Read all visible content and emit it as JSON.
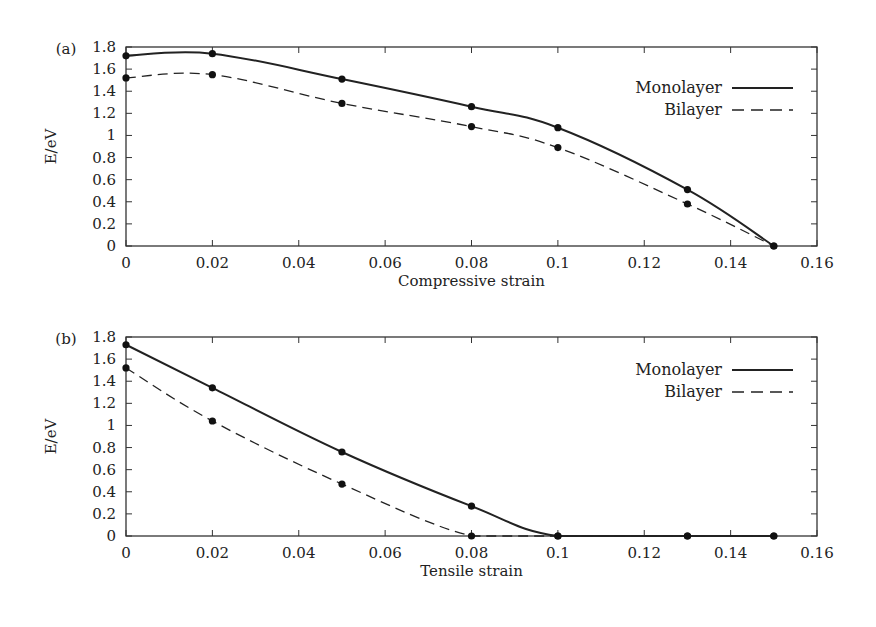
{
  "chart_data": [
    {
      "type": "line",
      "panel_label": "(a)",
      "xlabel": "Compressive strain",
      "ylabel": "E/eV",
      "xlim": [
        0,
        0.16
      ],
      "ylim": [
        0,
        1.8
      ],
      "xticks": [
        "0",
        "0.02",
        "0.04",
        "0.06",
        "0.08",
        "0.1",
        "0.12",
        "0.14",
        "0.16"
      ],
      "yticks": [
        "0",
        "0.2",
        "0.4",
        "0.6",
        "0.8",
        "1",
        "1.2",
        "1.4",
        "1.6",
        "1.8"
      ],
      "legend_position": "top-right",
      "x": [
        0,
        0.02,
        0.05,
        0.08,
        0.1,
        0.13,
        0.15
      ],
      "series": [
        {
          "name": "Monolayer",
          "style": "solid",
          "values": [
            1.72,
            1.74,
            1.51,
            1.26,
            1.07,
            0.51,
            0.0
          ]
        },
        {
          "name": "Bilayer",
          "style": "dashed",
          "values": [
            1.52,
            1.55,
            1.29,
            1.08,
            0.89,
            0.38,
            0.0
          ]
        }
      ]
    },
    {
      "type": "line",
      "panel_label": "(b)",
      "xlabel": "Tensile strain",
      "ylabel": "E/eV",
      "xlim": [
        0,
        0.16
      ],
      "ylim": [
        0,
        1.8
      ],
      "xticks": [
        "0",
        "0.02",
        "0.04",
        "0.06",
        "0.08",
        "0.1",
        "0.12",
        "0.14",
        "0.16"
      ],
      "yticks": [
        "0",
        "0.2",
        "0.4",
        "0.6",
        "0.8",
        "1",
        "1.2",
        "1.4",
        "1.6",
        "1.8"
      ],
      "legend_position": "top-right",
      "x": [
        0,
        0.02,
        0.05,
        0.08,
        0.1,
        0.13,
        0.15
      ],
      "series": [
        {
          "name": "Monolayer",
          "style": "solid",
          "values": [
            1.73,
            1.34,
            0.76,
            0.27,
            0.0,
            0.0,
            0.0
          ]
        },
        {
          "name": "Bilayer",
          "style": "dashed",
          "values": [
            1.52,
            1.04,
            0.47,
            0.0,
            0.0,
            0.0,
            0.0
          ]
        }
      ]
    }
  ],
  "colors": {
    "line": "#222222",
    "marker": "#111111",
    "axis": "#333333"
  }
}
